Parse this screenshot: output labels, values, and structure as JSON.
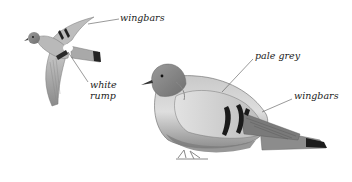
{
  "illustration": {
    "subject": "pigeon",
    "style": "greyscale",
    "flying_bird": {
      "labels": [
        {
          "id": "wingbars",
          "text": "wingbars"
        },
        {
          "id": "white_rump_line1",
          "text": "white"
        },
        {
          "id": "white_rump_line2",
          "text": "rump"
        }
      ]
    },
    "perched_bird": {
      "labels": [
        {
          "id": "pale_grey",
          "text": "pale grey"
        },
        {
          "id": "wingbars",
          "text": "wingbars"
        }
      ]
    }
  }
}
